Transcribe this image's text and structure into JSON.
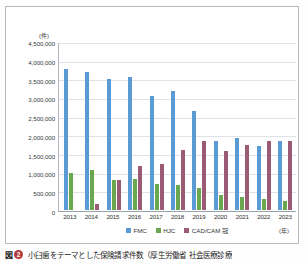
{
  "figure": {
    "caption_marker": "図",
    "caption_number": "2",
    "caption_text": "小臼歯をテーマとした保険請求件数（厚生労働省 社会医療診療"
  },
  "axes": {
    "y_unit": "(件)",
    "x_unit": "(年)"
  },
  "chart_data": {
    "type": "bar",
    "title": "",
    "subtitle": "",
    "xlabel": "(年)",
    "ylabel": "(件)",
    "ylim": [
      0,
      4500000
    ],
    "ytick_values": [
      0,
      500000,
      1000000,
      1500000,
      2000000,
      2500000,
      3000000,
      3500000,
      4000000,
      4500000
    ],
    "ytick_labels": [
      "0",
      "500,000",
      "1,000,000",
      "1,500,000",
      "2,000,000",
      "2,500,000",
      "3,000,000",
      "3,500,000",
      "4,000,000",
      "4,500,000"
    ],
    "grid": true,
    "legend_position": "bottom-center",
    "categories": [
      "2013",
      "2014",
      "2015",
      "2016",
      "2017",
      "2018",
      "2019",
      "2020",
      "2021",
      "2022",
      "2023"
    ],
    "series": [
      {
        "name": "FMC",
        "color": "#5b9bd5",
        "values": [
          3800000,
          3720000,
          3540000,
          3590000,
          3070000,
          3200000,
          2680000,
          1850000,
          1950000,
          1720000,
          1860000
        ]
      },
      {
        "name": "HJC",
        "color": "#6aa84f",
        "values": [
          1000000,
          1090000,
          820000,
          840000,
          700000,
          680000,
          580000,
          400000,
          350000,
          290000,
          240000
        ]
      },
      {
        "name": "CAD/CAM 冠",
        "color": "#9c5b75",
        "values": [
          0,
          160000,
          800000,
          1190000,
          1250000,
          1610000,
          1850000,
          1580000,
          1760000,
          1870000,
          1870000
        ]
      }
    ]
  }
}
